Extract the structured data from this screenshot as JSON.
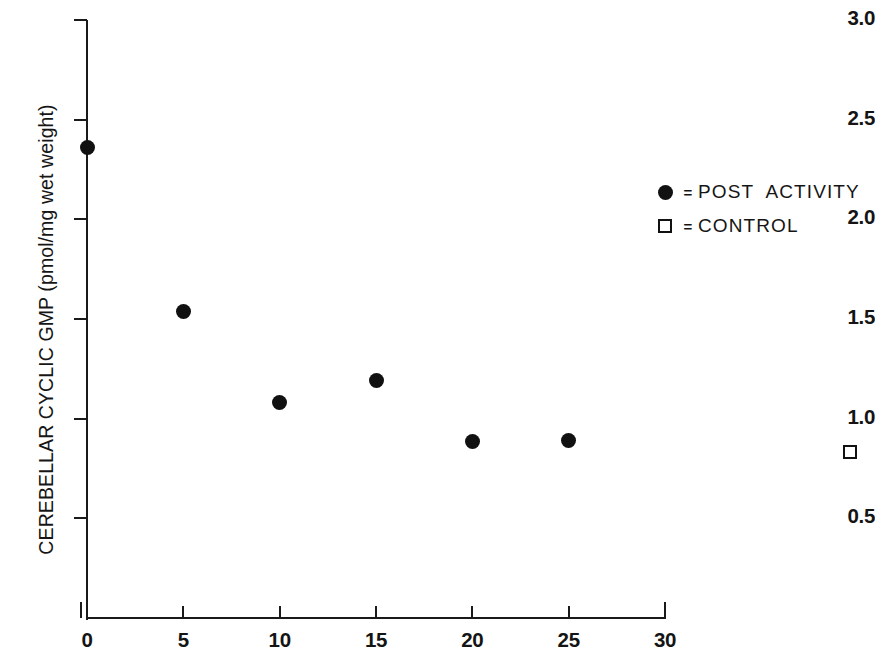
{
  "chart_data": {
    "type": "scatter",
    "title": "",
    "xlabel": "",
    "ylabel": "CEREBELLAR CYCLIC GMP (pmol/mg wet weight)",
    "xlim": [
      0,
      30
    ],
    "ylim": [
      0,
      3.0
    ],
    "xticks": [
      0,
      5,
      10,
      15,
      20,
      25,
      30
    ],
    "xtick_labels": [
      "0",
      "5",
      "10",
      "15",
      "20",
      "25",
      "30"
    ],
    "yticks": [
      0.5,
      1.0,
      1.5,
      2.0,
      2.5,
      3.0
    ],
    "ytick_labels": [
      "0.5",
      "1.0",
      "1.5",
      "2.0",
      "2.5",
      "3.0"
    ],
    "grid": false,
    "legend_position": "upper right",
    "series": [
      {
        "name": "POST ACTIVITY",
        "marker": "filled-circle",
        "color": "#111111",
        "points": [
          {
            "x": 0,
            "y": 2.36
          },
          {
            "x": 5,
            "y": 1.54
          },
          {
            "x": 10,
            "y": 1.08
          },
          {
            "x": 15,
            "y": 1.19
          },
          {
            "x": 20,
            "y": 0.885
          },
          {
            "x": 25,
            "y": 0.89
          }
        ]
      },
      {
        "name": "CONTROL",
        "marker": "open-square",
        "color": "#111111",
        "off_axis": true,
        "points": [
          {
            "x": 39.6,
            "y": 0.835
          }
        ]
      }
    ]
  },
  "legend": {
    "entries": [
      {
        "marker": "filled-circle",
        "equals": "=",
        "label": "POST  ACTIVITY"
      },
      {
        "marker": "open-square",
        "equals": "=",
        "label": "CONTROL"
      }
    ]
  },
  "colors": {
    "ink": "#141414",
    "marker": "#111111",
    "background": "#ffffff"
  }
}
